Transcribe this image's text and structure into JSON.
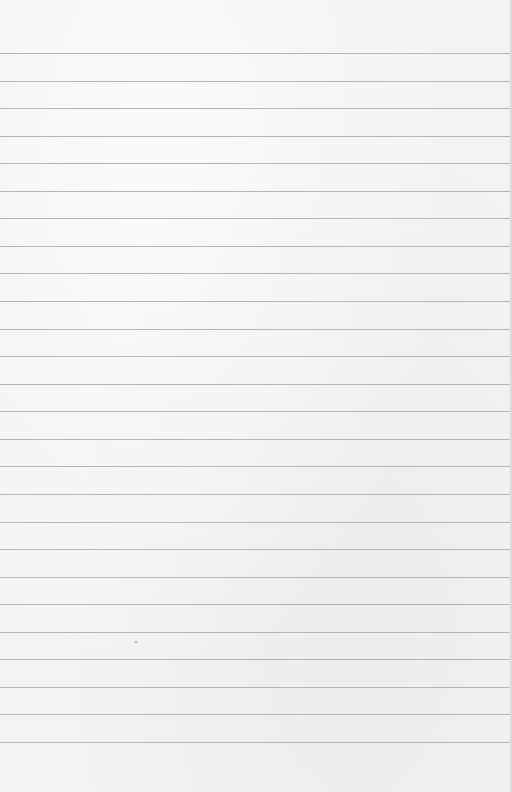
{
  "paper": {
    "background_color": "#f3f3f2",
    "line_color": "#a9a9a9",
    "line_count": 26,
    "first_line_y": 53,
    "line_spacing": 27.56,
    "line_width": 510
  },
  "specks": [
    {
      "x": 135,
      "y": 641
    }
  ]
}
